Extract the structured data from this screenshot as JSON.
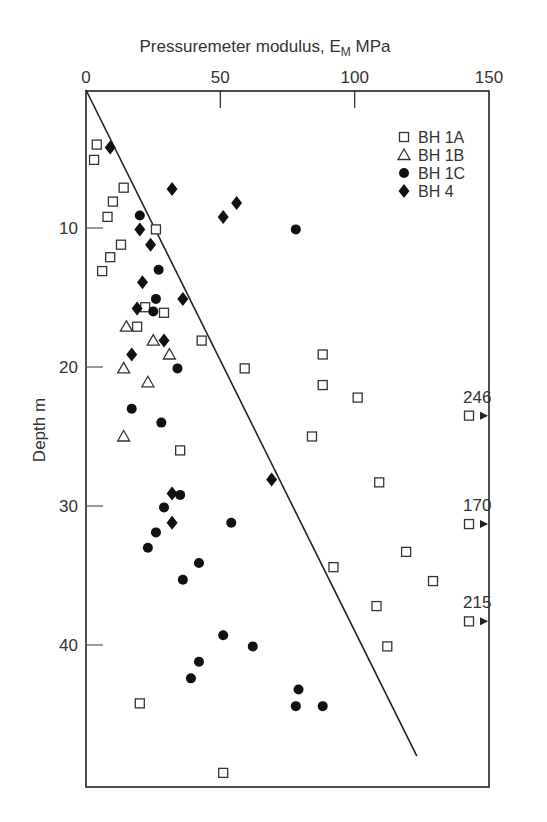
{
  "chart_data": {
    "type": "scatter",
    "title": "",
    "xlabel": "Pressuremeter modulus, E",
    "xlabel_sub": "M",
    "xlabel_unit": " MPa",
    "ylabel": "Depth m",
    "xlim": [
      0,
      150
    ],
    "ylim": [
      0,
      50
    ],
    "x_ticks": [
      0,
      50,
      100,
      150
    ],
    "y_ticks": [
      10,
      20,
      30,
      40
    ],
    "x_axis_position": "top",
    "y_inverted": true,
    "grid": false,
    "legend_position": "upper right",
    "series": [
      {
        "name": "BH 1A",
        "marker": "open-square",
        "points": [
          [
            4,
            4.0
          ],
          [
            3,
            5.1
          ],
          [
            14,
            7.1
          ],
          [
            10,
            8.1
          ],
          [
            8,
            9.2
          ],
          [
            26,
            10.1
          ],
          [
            13,
            11.2
          ],
          [
            9,
            12.1
          ],
          [
            6,
            13.1
          ],
          [
            22,
            15.7
          ],
          [
            29,
            16.1
          ],
          [
            19,
            17.1
          ],
          [
            43,
            18.1
          ],
          [
            88,
            19.1
          ],
          [
            59,
            20.1
          ],
          [
            88,
            21.3
          ],
          [
            101,
            22.2
          ],
          [
            84,
            25.0
          ],
          [
            35,
            26.0
          ],
          [
            109,
            28.3
          ],
          [
            119,
            33.3
          ],
          [
            92,
            34.4
          ],
          [
            129,
            35.4
          ],
          [
            108,
            37.2
          ],
          [
            112,
            40.1
          ],
          [
            20,
            44.2
          ],
          [
            51,
            49.2
          ]
        ]
      },
      {
        "name": "BH 1B",
        "marker": "open-triangle",
        "points": [
          [
            15,
            17.1
          ],
          [
            25,
            18.1
          ],
          [
            31,
            19.1
          ],
          [
            14,
            20.1
          ],
          [
            23,
            21.1
          ],
          [
            14,
            25.0
          ]
        ]
      },
      {
        "name": "BH 1C",
        "marker": "filled-circle",
        "points": [
          [
            20,
            9.1
          ],
          [
            78,
            10.1
          ],
          [
            27,
            13.0
          ],
          [
            26,
            15.1
          ],
          [
            25,
            16.0
          ],
          [
            34,
            20.1
          ],
          [
            17,
            23.0
          ],
          [
            28,
            24.0
          ],
          [
            35,
            29.2
          ],
          [
            29,
            30.1
          ],
          [
            54,
            31.2
          ],
          [
            26,
            31.9
          ],
          [
            23,
            33.0
          ],
          [
            42,
            34.1
          ],
          [
            36,
            35.3
          ],
          [
            51,
            39.3
          ],
          [
            62,
            40.1
          ],
          [
            42,
            41.2
          ],
          [
            39,
            42.4
          ],
          [
            79,
            43.2
          ],
          [
            78,
            44.4
          ],
          [
            88,
            44.4
          ]
        ]
      },
      {
        "name": "BH 4",
        "marker": "filled-diamond",
        "points": [
          [
            9,
            4.2
          ],
          [
            32,
            7.2
          ],
          [
            56,
            8.2
          ],
          [
            51,
            9.2
          ],
          [
            20,
            10.1
          ],
          [
            24,
            11.2
          ],
          [
            21,
            13.9
          ],
          [
            36,
            15.1
          ],
          [
            19,
            15.8
          ],
          [
            29,
            18.1
          ],
          [
            17,
            19.1
          ],
          [
            69,
            28.1
          ],
          [
            32,
            29.1
          ],
          [
            32,
            31.2
          ]
        ]
      }
    ],
    "off_scale_points": [
      {
        "series": "BH 1A",
        "depth": 23.5,
        "label": "246"
      },
      {
        "series": "BH 1A",
        "depth": 31.3,
        "label": "170"
      },
      {
        "series": "BH 1A",
        "depth": 38.3,
        "label": "215"
      }
    ],
    "trend_line": {
      "from": [
        0,
        0
      ],
      "to": [
        123,
        48
      ]
    }
  }
}
